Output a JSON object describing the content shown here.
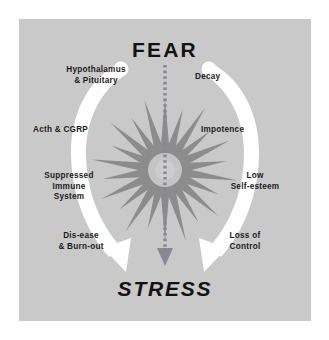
{
  "figure": {
    "title_top": "FEAR",
    "title_bottom": "STRESS",
    "panel_color": "#c9c9c9",
    "arc_color": "#ffffff",
    "starburst_color": "#8c8c8c",
    "text_color": "#1b1b1b",
    "arrow_color": "#8a8694"
  },
  "left_branch": {
    "name": "physiological-cascade",
    "items": [
      {
        "id": "hypothalamus",
        "label": "Hypothalamus\n& Pituitary"
      },
      {
        "id": "acth-cgrp",
        "label": "Acth & CGRP"
      },
      {
        "id": "suppressed-immune",
        "label": "Suppressed\nImmune\nSystem"
      },
      {
        "id": "disease-burnout",
        "label": "Dis-ease\n& Burn-out"
      }
    ]
  },
  "right_branch": {
    "name": "psychological-cascade",
    "items": [
      {
        "id": "decay",
        "label": "Decay"
      },
      {
        "id": "impotence",
        "label": "Impotence"
      },
      {
        "id": "low-self-esteem",
        "label": "Low\nSelf-esteem"
      },
      {
        "id": "loss-of-control",
        "label": "Loss of\nControl"
      }
    ]
  },
  "center": {
    "arrow_from": "FEAR",
    "arrow_to": "STRESS",
    "burst_points": 22
  }
}
